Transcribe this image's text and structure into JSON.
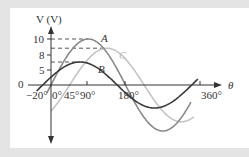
{
  "figure": {
    "y_axis_label": "V (V)",
    "x_axis_label": "θ",
    "origin_label": "0",
    "y_ticks": [
      "10",
      "8",
      "5"
    ],
    "x_ticks": [
      "−20°",
      "0°",
      "45°",
      "90°",
      "180°",
      "360°"
    ],
    "curve_labels": [
      "A",
      "B",
      "C"
    ]
  },
  "colors": {
    "background": "#e4e4e4",
    "panel": "#ffffff",
    "curve_A": "#8a8a8a",
    "curve_B": "#3a3a3a",
    "curve_C": "#c4c4c4",
    "axes": "#333333"
  },
  "chart_data": {
    "type": "line",
    "title": "",
    "xlabel": "θ",
    "ylabel": "V (V)",
    "xlim": [
      -20,
      380
    ],
    "ylim": [
      -10,
      10
    ],
    "grid": false,
    "x_ticks": [
      -20,
      0,
      45,
      90,
      180,
      360
    ],
    "y_ticks": [
      5,
      8,
      10
    ],
    "series": [
      {
        "name": "A",
        "amplitude": 10,
        "phase_deg": 0,
        "function": "10 sin(θ)",
        "peak_at_deg": 90,
        "color": "#8a8a8a"
      },
      {
        "name": "B",
        "amplitude": 5,
        "phase_deg": 20,
        "function": "5 sin(θ + 20°)",
        "peak_at_deg": 70,
        "color": "#3a3a3a"
      },
      {
        "name": "C",
        "amplitude": 8,
        "phase_deg": -45,
        "function": "8 sin(θ − 45°)",
        "peak_at_deg": 135,
        "color": "#c4c4c4"
      }
    ],
    "annotations": [
      "dashed lines from V axis at 10, 8, 5 to peaks of A, C, B"
    ]
  }
}
